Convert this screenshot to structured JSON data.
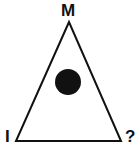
{
  "diagram": {
    "labels": {
      "top": "M",
      "bottom_left": "I",
      "bottom_right": "?"
    },
    "shape": "triangle",
    "marker": "filled-circle",
    "colors": {
      "stroke": "#111111",
      "fill": "#ffffff",
      "marker": "#111111"
    }
  }
}
